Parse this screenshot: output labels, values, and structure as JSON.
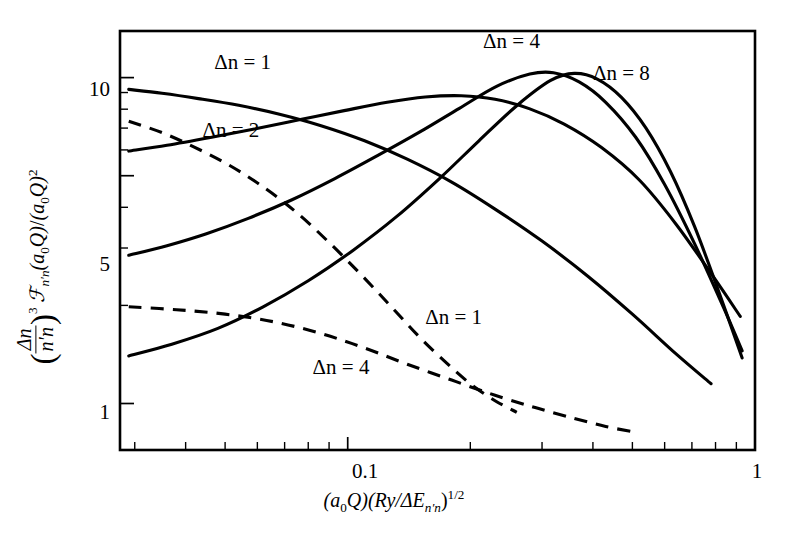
{
  "figure": {
    "background": "#ffffff",
    "ink_color": "#000000",
    "y_axis_label_parts": {
      "open_paren": "(",
      "frac_num": "Δn",
      "frac_den": "n′n",
      "close_paren": ")",
      "exponent": "3",
      "script_F": "ℱ",
      "F_sub": "n′n",
      "F_arg": "(a",
      "a_sub": "0",
      "Q_close": "Q)",
      "slash": "/",
      "denom": "(a",
      "denom_sub": "0",
      "denom_close": "Q)",
      "denom_exp": "2"
    },
    "x_axis_label_parts": {
      "first": "(a",
      "first_sub": "0",
      "first_close": "Q)(Ry/ΔE",
      "E_sub": "n′n",
      "close": ")",
      "exponent": "1/2"
    }
  },
  "chart_data": {
    "type": "line",
    "title": "",
    "subtitle": "",
    "xlabel": "(a0Q)(Ry/ΔE_n'n)^(1/2)",
    "ylabel": "(Δn/n'n)^3 F_n'n(a0Q)/(a0Q)^2",
    "xscale": "log",
    "yscale": "log",
    "xlim": [
      0.0276,
      1.0
    ],
    "ylim": [
      0.72,
      13.9
    ],
    "grid": false,
    "legend": "inline-annotations",
    "x_ticks_labeled": [
      {
        "value": 0.1,
        "label": "0.1"
      },
      {
        "value": 1.0,
        "label": "1"
      }
    ],
    "x_ticks_minor": [
      0.03,
      0.04,
      0.05,
      0.06,
      0.07,
      0.08,
      0.09,
      0.2,
      0.3,
      0.4,
      0.5,
      0.6,
      0.7,
      0.8,
      0.9
    ],
    "y_ticks_labeled": [
      {
        "value": 10,
        "label": "10"
      },
      {
        "value": 5,
        "label": "5"
      },
      {
        "value": 1,
        "label": "1"
      }
    ],
    "y_ticks_minor": [
      2,
      3,
      4,
      6,
      7,
      8,
      9
    ],
    "series": [
      {
        "name": "Δn = 1 (solid)",
        "style": "solid",
        "label": "Δn = 1",
        "label_x": 0.047,
        "label_y": 10.6,
        "points": [
          [
            0.029,
            9.2
          ],
          [
            0.035,
            8.95
          ],
          [
            0.043,
            8.62
          ],
          [
            0.054,
            8.22
          ],
          [
            0.068,
            7.72
          ],
          [
            0.086,
            7.12
          ],
          [
            0.11,
            6.4
          ],
          [
            0.14,
            5.62
          ],
          [
            0.18,
            4.78
          ],
          [
            0.23,
            3.95
          ],
          [
            0.3,
            3.15
          ],
          [
            0.39,
            2.45
          ],
          [
            0.5,
            1.88
          ],
          [
            0.64,
            1.42
          ],
          [
            0.78,
            1.15
          ]
        ]
      },
      {
        "name": "Δn = 2 (solid)",
        "style": "solid",
        "label": "Δn = 2",
        "label_x": 0.044,
        "label_y": 6.55,
        "points": [
          [
            0.029,
            5.95
          ],
          [
            0.036,
            6.2
          ],
          [
            0.046,
            6.55
          ],
          [
            0.059,
            6.95
          ],
          [
            0.076,
            7.42
          ],
          [
            0.098,
            7.92
          ],
          [
            0.125,
            8.4
          ],
          [
            0.155,
            8.72
          ],
          [
            0.19,
            8.8
          ],
          [
            0.23,
            8.58
          ],
          [
            0.28,
            8.02
          ],
          [
            0.34,
            7.2
          ],
          [
            0.42,
            6.1
          ],
          [
            0.52,
            4.85
          ],
          [
            0.64,
            3.55
          ],
          [
            0.79,
            2.45
          ],
          [
            0.92,
            1.85
          ]
        ]
      },
      {
        "name": "Δn = 4 (solid)",
        "style": "solid",
        "label": "Δn = 4",
        "label_x": 0.082,
        "label_y": 1.23,
        "points": [
          [
            0.029,
            2.85
          ],
          [
            0.036,
            3.05
          ],
          [
            0.045,
            3.32
          ],
          [
            0.057,
            3.7
          ],
          [
            0.073,
            4.22
          ],
          [
            0.093,
            4.9
          ],
          [
            0.118,
            5.75
          ],
          [
            0.15,
            6.8
          ],
          [
            0.188,
            8.05
          ],
          [
            0.232,
            9.4
          ],
          [
            0.28,
            10.25
          ],
          [
            0.32,
            10.35
          ],
          [
            0.37,
            9.7
          ],
          [
            0.43,
            8.4
          ],
          [
            0.51,
            6.55
          ],
          [
            0.6,
            4.7
          ],
          [
            0.71,
            3.1
          ],
          [
            0.84,
            1.95
          ],
          [
            0.93,
            1.45
          ]
        ]
      },
      {
        "name": "Δn = 8 (solid)",
        "style": "solid",
        "label": "Δn = 8",
        "label_x": 0.285,
        "label_y": 9.35,
        "points": [
          [
            0.029,
            1.4
          ],
          [
            0.037,
            1.52
          ],
          [
            0.048,
            1.7
          ],
          [
            0.062,
            1.98
          ],
          [
            0.08,
            2.38
          ],
          [
            0.103,
            2.95
          ],
          [
            0.132,
            3.75
          ],
          [
            0.168,
            4.9
          ],
          [
            0.21,
            6.4
          ],
          [
            0.26,
            8.2
          ],
          [
            0.315,
            9.8
          ],
          [
            0.36,
            10.3
          ],
          [
            0.41,
            9.9
          ],
          [
            0.47,
            8.7
          ],
          [
            0.54,
            7.0
          ],
          [
            0.62,
            5.15
          ],
          [
            0.71,
            3.5
          ],
          [
            0.81,
            2.25
          ],
          [
            0.93,
            1.38
          ]
        ]
      },
      {
        "name": "Δn = 2 (dashed)",
        "style": "dashed",
        "label": "",
        "label_x": null,
        "label_y": null,
        "points": [
          [
            0.029,
            7.35
          ],
          [
            0.035,
            6.78
          ],
          [
            0.042,
            6.12
          ],
          [
            0.051,
            5.4
          ],
          [
            0.062,
            4.62
          ],
          [
            0.075,
            3.85
          ],
          [
            0.09,
            3.12
          ],
          [
            0.108,
            2.48
          ],
          [
            0.128,
            1.98
          ],
          [
            0.15,
            1.6
          ],
          [
            0.175,
            1.33
          ],
          [
            0.2,
            1.15
          ],
          [
            0.23,
            1.02
          ],
          [
            0.26,
            0.94
          ]
        ]
      },
      {
        "name": "Δn = 1 (dashed)",
        "style": "dashed",
        "label": "Δn = 1",
        "label_x": 0.155,
        "label_y": 1.75,
        "points": [
          [
            0.029,
            1.98
          ],
          [
            0.038,
            1.94
          ],
          [
            0.05,
            1.88
          ],
          [
            0.066,
            1.78
          ],
          [
            0.086,
            1.64
          ],
          [
            0.11,
            1.48
          ],
          [
            0.14,
            1.32
          ],
          [
            0.18,
            1.18
          ],
          [
            0.23,
            1.06
          ],
          [
            0.29,
            0.97
          ],
          [
            0.36,
            0.9
          ],
          [
            0.43,
            0.85
          ],
          [
            0.5,
            0.82
          ]
        ]
      }
    ],
    "annotations": [
      {
        "text": "Δn = 1",
        "x": 0.047,
        "y": 10.6
      },
      {
        "text": "Δn = 2",
        "x": 0.044,
        "y": 6.55
      },
      {
        "text": "Δn = 4",
        "x": 0.215,
        "y": 12.3
      },
      {
        "text": "Δn = 8",
        "x": 0.4,
        "y": 9.8
      },
      {
        "text": "Δn = 1",
        "x": 0.155,
        "y": 1.75
      },
      {
        "text": "Δn = 4",
        "x": 0.082,
        "y": 1.23
      }
    ]
  },
  "tick_text": {
    "x_01": "0.1",
    "x_1": "1",
    "y_10": "10",
    "y_5": "5",
    "y_1": "1"
  },
  "curve_labels": {
    "top_dn1": "Δn = 1",
    "dn2": "Δn = 2",
    "dn4_top": "Δn = 4",
    "dn8": "Δn = 8",
    "dn1_low": "Δn = 1",
    "dn4_low": "Δn = 4"
  }
}
